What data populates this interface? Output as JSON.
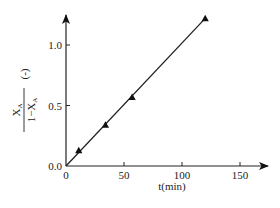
{
  "chart_data": {
    "type": "line",
    "title": "",
    "xlabel": "t(min)",
    "ylabel": {
      "numerator": "X_A",
      "denominator": "1 − X_A",
      "unit": "(-)"
    },
    "xlim": [
      0,
      170
    ],
    "ylim": [
      0,
      1.35
    ],
    "xticks": [
      0,
      50,
      100,
      150
    ],
    "yticks": [
      0.0,
      0.5,
      1.0
    ],
    "xtick_labels": [
      "0",
      "50",
      "100",
      "150"
    ],
    "ytick_labels": [
      "0.0",
      "0.5",
      "1.0"
    ],
    "grid": false,
    "legend": null,
    "series": [
      {
        "name": "X_A/(1-X_A)",
        "marker": "filled-triangle",
        "line": "linear fit through origin",
        "x": [
          11,
          34,
          57,
          120
        ],
        "y": [
          0.13,
          0.34,
          0.57,
          1.22
        ]
      }
    ],
    "fit_line": {
      "x": [
        0,
        120
      ],
      "y": [
        0,
        1.22
      ]
    }
  },
  "labels": {
    "x_axis": "t(min)",
    "y_num": "X",
    "y_num_sub": "A",
    "y_den_prefix": "1−X",
    "y_den_sub": "A",
    "y_unit": "(-)"
  }
}
